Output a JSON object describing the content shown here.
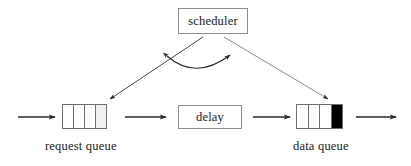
{
  "diagram": {
    "title_text": "scheduler queue pipeline diagram",
    "background_color": "#ffffff",
    "line_color": "#3a3a3a",
    "box_border_color": "#8e8e8e",
    "nodes": {
      "scheduler": {
        "label": "scheduler",
        "shape": "rectangle"
      },
      "delay": {
        "label": "delay",
        "shape": "rectangle"
      },
      "request_queue": {
        "caption": "request queue",
        "shape": "queue",
        "cell_count": 4,
        "cells": [
          {
            "state": "empty",
            "fill": "#ffffff"
          },
          {
            "state": "empty",
            "fill": "#ffffff"
          },
          {
            "state": "empty",
            "fill": "#ffffff"
          },
          {
            "state": "shaded",
            "fill": "#f0f0f0"
          }
        ]
      },
      "data_queue": {
        "caption": "data queue",
        "shape": "queue",
        "cell_count": 4,
        "cells": [
          {
            "state": "empty",
            "fill": "#ffffff"
          },
          {
            "state": "empty",
            "fill": "#ffffff"
          },
          {
            "state": "empty",
            "fill": "#ffffff"
          },
          {
            "state": "filled",
            "fill": "#000000"
          }
        ]
      }
    },
    "connectors": [
      {
        "name": "input-arrow",
        "type": "straight",
        "direction": "right",
        "label": ""
      },
      {
        "name": "request-queue-to-delay-arrow",
        "type": "straight",
        "direction": "right",
        "label": ""
      },
      {
        "name": "delay-to-data-queue-arrow",
        "type": "straight",
        "direction": "right",
        "label": ""
      },
      {
        "name": "output-arrow",
        "type": "straight",
        "direction": "right",
        "label": ""
      },
      {
        "name": "scheduler-to-request-queue-arrow",
        "type": "diagonal",
        "direction": "down-left",
        "label": ""
      },
      {
        "name": "scheduler-to-data-queue-arrow",
        "type": "diagonal",
        "direction": "down-right",
        "label": ""
      },
      {
        "name": "queue-sync-arc",
        "type": "curved",
        "direction": "bidirectional",
        "label": ""
      }
    ]
  }
}
